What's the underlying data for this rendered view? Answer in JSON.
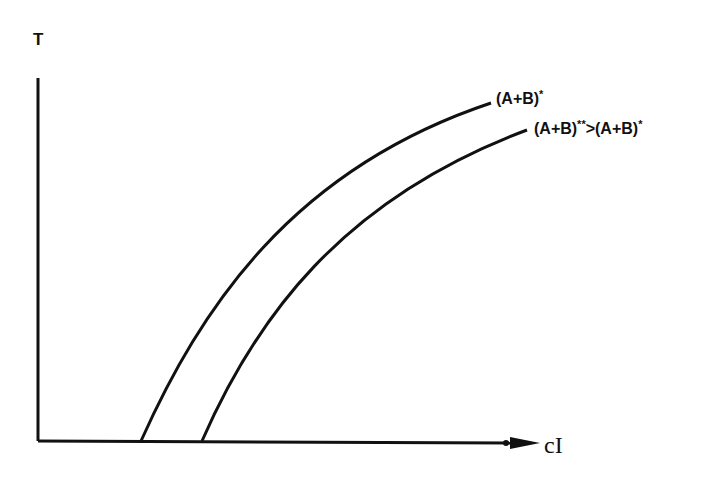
{
  "diagram": {
    "y_axis_label": "T",
    "x_axis_label": "cI",
    "curves": [
      {
        "label_main": "(A+B)",
        "label_sup": "*"
      },
      {
        "label_main": "(A+B)",
        "label_sup": "**",
        "label_rest": ">(A+B)",
        "label_rest_sup": "*"
      }
    ],
    "line_color": "#111111"
  }
}
